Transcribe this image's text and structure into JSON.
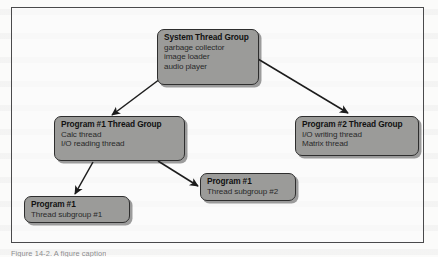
{
  "figure": {
    "nodes": [
      {
        "id": "system",
        "title": "System Thread Group",
        "lines": [
          "garbage collector",
          "image loader",
          "audio player"
        ]
      },
      {
        "id": "program1_group",
        "title": "Program #1 Thread Group",
        "lines": [
          "Calc thread",
          "I/O reading thread"
        ]
      },
      {
        "id": "program2_group",
        "title": "Program #2 Thread Group",
        "lines": [
          "I/O writing thread",
          "Matrix thread"
        ]
      },
      {
        "id": "subgroup1",
        "title": "Program #1",
        "lines": [
          "Thread subgroup #1"
        ]
      },
      {
        "id": "subgroup2",
        "title": "Program #1",
        "lines": [
          "Thread subgroup #2"
        ]
      }
    ],
    "caption": "Figure 14-2. A figure caption",
    "colors": {
      "node_fill": "#9b9b99",
      "node_border": "#2e2e2e",
      "frame_border": "#4a4a4c",
      "arrow": "#1c1c1c",
      "page_background": "#fbfbfa"
    }
  }
}
